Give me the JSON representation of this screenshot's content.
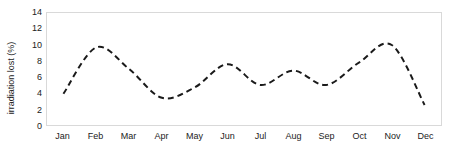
{
  "chart_data": {
    "type": "line",
    "title": "",
    "xlabel": "",
    "ylabel": "irradiation lost (%)",
    "categories": [
      "Jan",
      "Feb",
      "Mar",
      "Apr",
      "May",
      "Jun",
      "Jul",
      "Aug",
      "Sep",
      "Oct",
      "Nov",
      "Dec"
    ],
    "values": [
      3.9,
      9.7,
      7.0,
      3.4,
      4.7,
      7.6,
      5.0,
      6.8,
      5.0,
      7.8,
      10.0,
      2.5
    ],
    "series": [
      {
        "name": "irradiation lost",
        "values": [
          3.9,
          9.7,
          7.0,
          3.4,
          4.7,
          7.6,
          5.0,
          6.8,
          5.0,
          7.8,
          10.0,
          2.5
        ]
      }
    ],
    "ylim": [
      0,
      14
    ],
    "y_ticks": [
      0,
      2,
      4,
      6,
      8,
      10,
      12,
      14
    ],
    "y_tick_labels": [
      "0",
      "2",
      "4",
      "6",
      "8",
      "10",
      "12",
      "14"
    ],
    "grid": false,
    "legend": false,
    "line_style": "dashed",
    "line_color": "#1a1a1a",
    "smoothing": true,
    "plot_border_color": "#d9d9d9",
    "background_color": "#ffffff",
    "text_color": "#222222"
  }
}
